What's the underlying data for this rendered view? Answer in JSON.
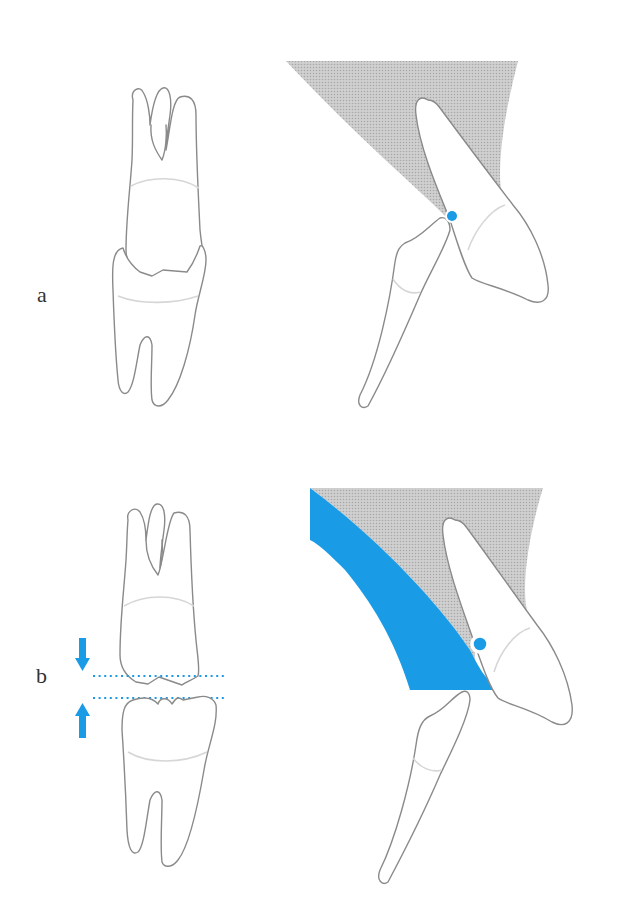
{
  "figure": {
    "panels": [
      {
        "id": "a",
        "label": "a",
        "description": "Molars in occlusion (lateral view) and incisors in contact; contact point marked with blue dot"
      },
      {
        "id": "b",
        "label": "b",
        "description": "Molars separated (vertical opening indicated by arrows and dotted lines); incisors with blue area showing additional space, contact point marked with ring"
      }
    ],
    "colors": {
      "accent_blue": "#1a9be6",
      "shading_gray": "#c4c4c4",
      "outline_gray": "#8a8a8a",
      "cej_gray": "#d6d6d6",
      "label_text": "#333333"
    },
    "markers": {
      "panel_a_contact": "filled-dot",
      "panel_b_contact": "ring",
      "panel_b_arrows": [
        "down-arrow",
        "up-arrow"
      ],
      "panel_b_guides": [
        "dotted-line-upper",
        "dotted-line-lower"
      ]
    }
  }
}
